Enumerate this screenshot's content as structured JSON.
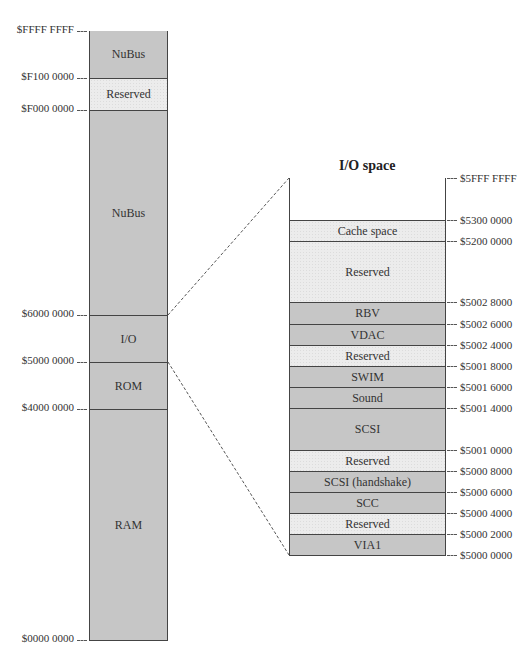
{
  "main_map": {
    "segments": [
      {
        "label": "NuBus",
        "shade": "dark",
        "top": 31,
        "bottom": 78
      },
      {
        "label": "Reserved",
        "shade": "light",
        "top": 78,
        "bottom": 110
      },
      {
        "label": "NuBus",
        "shade": "dark",
        "top": 110,
        "bottom": 315
      },
      {
        "label": "I/O",
        "shade": "dark",
        "top": 315,
        "bottom": 362
      },
      {
        "label": "ROM",
        "shade": "dark",
        "top": 362,
        "bottom": 409
      },
      {
        "label": "RAM",
        "shade": "dark",
        "top": 409,
        "bottom": 640
      }
    ],
    "addresses": [
      {
        "text": "$FFFF FFFF",
        "y": 31
      },
      {
        "text": "$F100 0000",
        "y": 78
      },
      {
        "text": "$F000 0000",
        "y": 110
      },
      {
        "text": "$6000 0000",
        "y": 315
      },
      {
        "text": "$5000 0000",
        "y": 362
      },
      {
        "text": "$4000 0000",
        "y": 409
      },
      {
        "text": "$0000 0000",
        "y": 640
      }
    ]
  },
  "io_map": {
    "title": "I/O space",
    "segments": [
      {
        "label": "",
        "shade": "white",
        "top": 178,
        "bottom": 220
      },
      {
        "label": "Cache space",
        "shade": "light",
        "top": 220,
        "bottom": 241
      },
      {
        "label": "Reserved",
        "shade": "light",
        "top": 241,
        "bottom": 302
      },
      {
        "label": "RBV",
        "shade": "dark",
        "top": 302,
        "bottom": 324
      },
      {
        "label": "VDAC",
        "shade": "dark",
        "top": 324,
        "bottom": 345
      },
      {
        "label": "Reserved",
        "shade": "light",
        "top": 345,
        "bottom": 366
      },
      {
        "label": "SWIM",
        "shade": "dark",
        "top": 366,
        "bottom": 387
      },
      {
        "label": "Sound",
        "shade": "dark",
        "top": 387,
        "bottom": 408
      },
      {
        "label": "SCSI",
        "shade": "dark",
        "top": 408,
        "bottom": 450
      },
      {
        "label": "Reserved",
        "shade": "light",
        "top": 450,
        "bottom": 471
      },
      {
        "label": "SCSI (handshake)",
        "shade": "dark",
        "top": 471,
        "bottom": 492
      },
      {
        "label": "SCC",
        "shade": "dark",
        "top": 492,
        "bottom": 513
      },
      {
        "label": "Reserved",
        "shade": "light",
        "top": 513,
        "bottom": 534
      },
      {
        "label": "VIA1",
        "shade": "dark",
        "top": 534,
        "bottom": 555
      }
    ],
    "addresses": [
      {
        "text": "$5FFF FFFF",
        "y": 178
      },
      {
        "text": "$5300 0000",
        "y": 220
      },
      {
        "text": "$5200 0000",
        "y": 241
      },
      {
        "text": "$5002 8000",
        "y": 302
      },
      {
        "text": "$5002 6000",
        "y": 324
      },
      {
        "text": "$5002 4000",
        "y": 345
      },
      {
        "text": "$5001 8000",
        "y": 366
      },
      {
        "text": "$5001 6000",
        "y": 387
      },
      {
        "text": "$5001 4000",
        "y": 408
      },
      {
        "text": "$5001 0000",
        "y": 450
      },
      {
        "text": "$5000 8000",
        "y": 471
      },
      {
        "text": "$5000 6000",
        "y": 492
      },
      {
        "text": "$5000 4000",
        "y": 513
      },
      {
        "text": "$5000 2000",
        "y": 534
      },
      {
        "text": "$5000 0000",
        "y": 555
      }
    ]
  },
  "colors": {
    "dark_fill": "#c6c6c6",
    "light_fill": "#ececec",
    "border": "#444444"
  }
}
